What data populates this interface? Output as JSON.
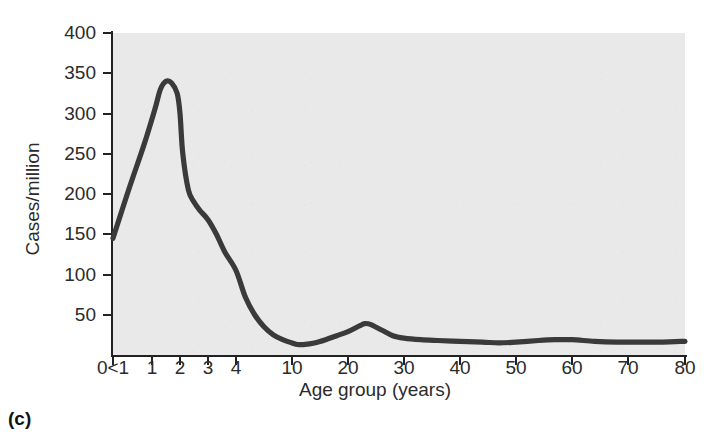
{
  "figure": {
    "caption": "(c)"
  },
  "chart_data": {
    "type": "line",
    "title": "",
    "xlabel": "Age group (years)",
    "ylabel": "Cases/million",
    "grid": false,
    "legend": null,
    "xlim": [
      0,
      80
    ],
    "ylim": [
      0,
      400
    ],
    "x_scale": "piecewise (ages 0-4 expanded, 4-80 compressed)",
    "x_tick_labels": [
      "0<1",
      "1",
      "2",
      "3",
      "4",
      "10",
      "20",
      "30",
      "40",
      "50",
      "60",
      "70",
      "80"
    ],
    "x_tick_values": [
      0.5,
      1,
      2,
      3,
      4,
      10,
      20,
      30,
      40,
      50,
      60,
      70,
      80
    ],
    "y_tick_labels": [
      "50",
      "100",
      "150",
      "200",
      "250",
      "300",
      "350",
      "400"
    ],
    "y_tick_values": [
      50,
      100,
      150,
      200,
      250,
      300,
      350,
      400
    ],
    "series": [
      {
        "name": "Cases per million",
        "x": [
          0.5,
          0.7,
          0.9,
          1.1,
          1.3,
          1.5,
          1.7,
          1.9,
          2.0,
          2.1,
          2.3,
          2.5,
          2.7,
          3.0,
          3.3,
          3.6,
          4.0,
          5.0,
          6.0,
          7.0,
          8.0,
          9.0,
          10.0,
          11.0,
          12.0,
          14.0,
          16.0,
          18.0,
          20.0,
          22.0,
          23.0,
          24.0,
          26.0,
          28.0,
          30.0,
          33.0,
          36.0,
          40.0,
          44.0,
          47.0,
          50.0,
          54.0,
          57.0,
          60.0,
          64.0,
          68.0,
          72.0,
          76.0,
          80.0
        ],
        "y": [
          145,
          205,
          262,
          305,
          330,
          340,
          338,
          325,
          300,
          250,
          205,
          190,
          180,
          168,
          150,
          128,
          105,
          72,
          50,
          35,
          25,
          19,
          15,
          13,
          13,
          15,
          19,
          24,
          29,
          36,
          39,
          38,
          31,
          24,
          21,
          19,
          18,
          17,
          16,
          15,
          16,
          18,
          19,
          19,
          17,
          16,
          16,
          16,
          17
        ]
      }
    ],
    "annotations": [
      {
        "text": "peak near age 1-2",
        "value": 340
      },
      {
        "text": "trough near age 11-12",
        "value": 13
      },
      {
        "text": "secondary bump near age 23",
        "value": 39
      }
    ],
    "colors": {
      "line": "#3a3a3a",
      "plot_background": "#e9e9e9",
      "axis": "#222222",
      "text": "#2b2b2b"
    }
  }
}
